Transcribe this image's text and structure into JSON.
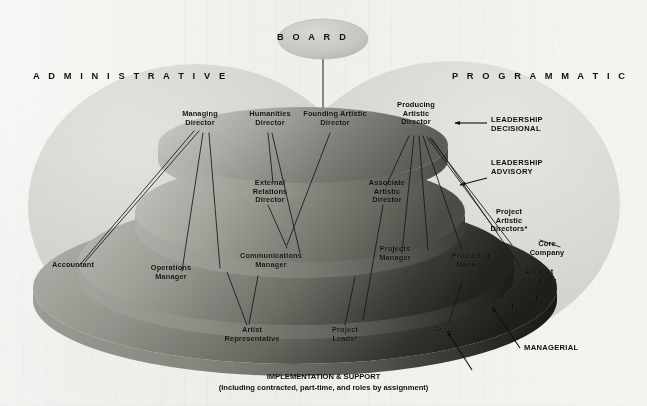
{
  "diagram": {
    "title_board": "B O A R D",
    "board_plain": "BOARD",
    "side_headers": {
      "left": "A D M I N I S T R A T I V E",
      "right": "P R O G R A M M A T I C",
      "left_plain": "ADMINISTRATIVE",
      "right_plain": "PROGRAMMATIC"
    },
    "tiers": [
      {
        "id": "leadership-decisional",
        "annotation": "LEADERSHIP\nDECISIONAL",
        "roles": [
          "Managing\nDirector",
          "Humanities\nDirector",
          "Founding Artistic\nDirector",
          "Producing\nArtistic\nDirector"
        ]
      },
      {
        "id": "leadership-advisory",
        "annotation": "LEADERSHIP\nADVISORY",
        "roles": [
          "External\nRelations\nDirector",
          "Associate\nArtistic\nDirector"
        ]
      },
      {
        "id": "managerial",
        "annotation": "MANAGERIAL",
        "roles": [
          "Accountant",
          "Operations\nManager",
          "Communications\nManager",
          "Projects\nManager",
          "Production\nManager",
          "Project\nArtistic\nDirectors*",
          "Core\nCompany",
          "Adjunct\nCompany"
        ]
      },
      {
        "id": "implementation-support",
        "annotation": "IMPLEMENTATION & SUPPORT",
        "annotation_sub": "(Including contracted, part-time, and roles by assignment)",
        "roles": [
          "Artist\nRepresentative",
          "Project\nLeads*",
          "Faculty*",
          "Production\nTeam"
        ]
      }
    ],
    "labels": {
      "managing_director": "Managing\nDirector",
      "humanities_director": "Humanities\nDirector",
      "founding_artistic_director": "Founding Artistic\nDirector",
      "producing_artistic_director": "Producing\nArtistic\nDirector",
      "external_relations_director": "External\nRelations\nDirector",
      "associate_artistic_director": "Associate\nArtistic\nDirector",
      "accountant": "Accountant",
      "operations_manager": "Operations\nManager",
      "communications_manager": "Communications\nManager",
      "projects_manager": "Projects\nManager",
      "production_manager": "Production\nManager",
      "project_artistic_directors": "Project\nArtistic\nDirectors*",
      "core_company": "Core\nCompany",
      "adjunct_company": "Adjunct\nCompany",
      "production_team": "Production\nTeam",
      "artist_representative": "Artist\nRepresentative",
      "project_leads": "Project\nLeads*",
      "faculty": "Faculty*"
    },
    "annotations": {
      "leadership_decisional": "LEADERSHIP\nDECISIONAL",
      "leadership_advisory": "LEADERSHIP\nADVISORY",
      "managerial": "MANAGERIAL",
      "implementation_support": "IMPLEMENTATION & SUPPORT",
      "implementation_support_note": "(Including contracted, part-time, and roles by assignment)"
    },
    "colors": {
      "background": "#eeeeea",
      "dome_light": "#d3d3cf",
      "tier_top_light": "#bdbdb8",
      "tier_top_dark": "#6e6e68",
      "tier_mid_light": "#b4b4af",
      "tier_mid_dark": "#5a5a55",
      "tier_base_light": "#9c9c97",
      "tier_base_dark": "#262624",
      "board_fill": "#c9c9c5",
      "text": "#14140f",
      "leader_line": "#1a1a16"
    }
  }
}
